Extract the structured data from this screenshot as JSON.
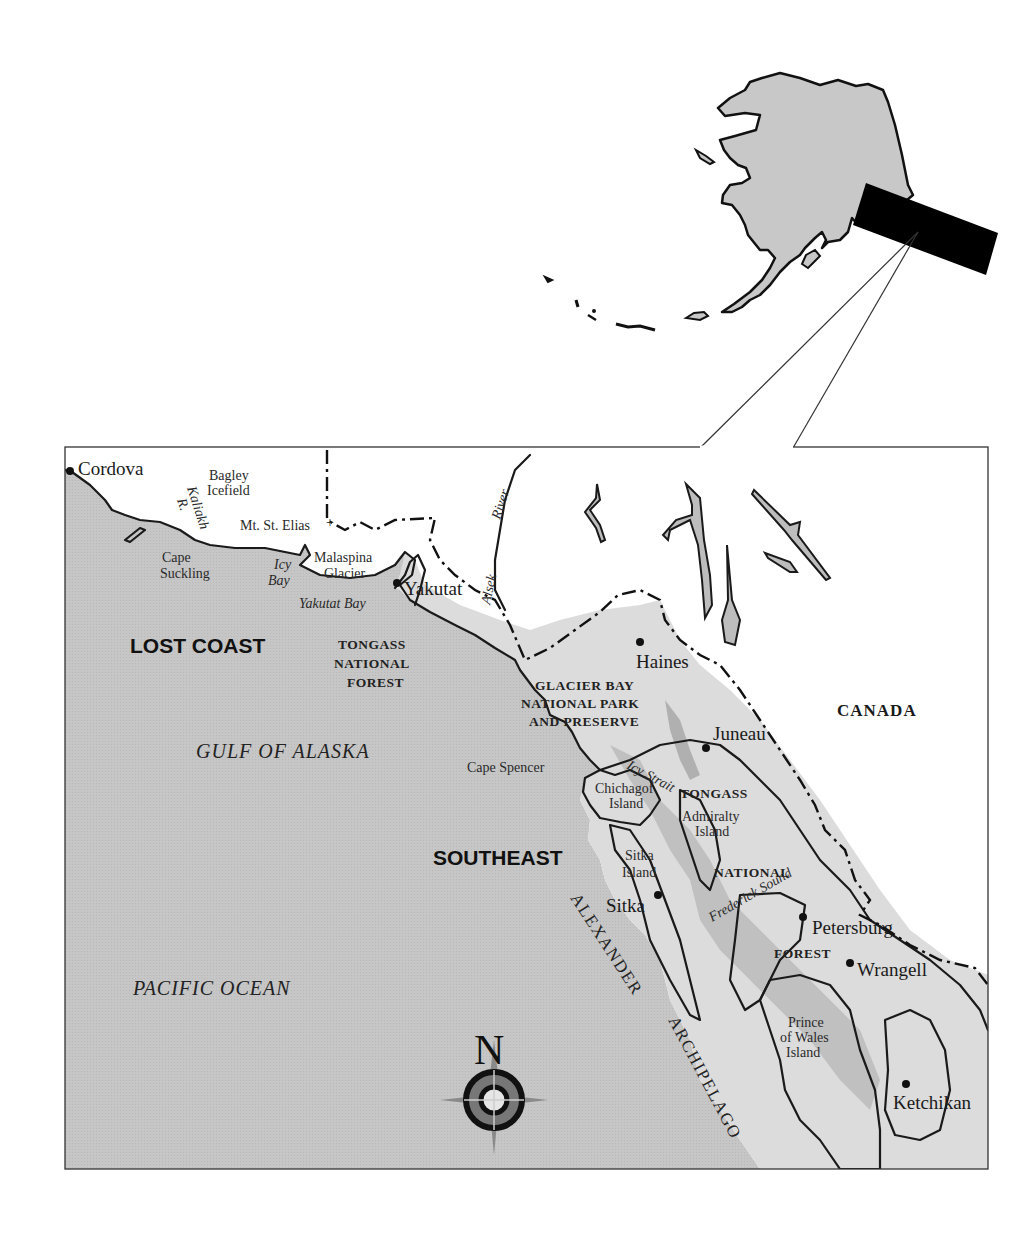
{
  "inset": {
    "title": "Alaska locator",
    "highlight_color": "#000000",
    "land_color": "#c8c8c8"
  },
  "colors": {
    "ocean": "#c4c4c4",
    "forest_land": "#dedede",
    "forest_dark": "#b4b4b4",
    "foreign_land": "#ffffff",
    "line": "#1a1a1a"
  },
  "cities": [
    {
      "name": "Cordova"
    },
    {
      "name": "Yakutat"
    },
    {
      "name": "Haines"
    },
    {
      "name": "Juneau"
    },
    {
      "name": "Sitka"
    },
    {
      "name": "Petersburg"
    },
    {
      "name": "Wrangell"
    },
    {
      "name": "Ketchikan"
    }
  ],
  "features": {
    "bagley": [
      "Bagley",
      "Icefield"
    ],
    "kaliakh": [
      "Kaliakh",
      "R."
    ],
    "mt_st_elias": "Mt. St. Elias",
    "cape_suckling": [
      "Cape",
      "Suckling"
    ],
    "icy_bay": [
      "Icy",
      "Bay"
    ],
    "malaspina": [
      "Malaspina",
      "Glacier"
    ],
    "yakutat_bay": "Yakutat Bay",
    "alsek": [
      "Alsek",
      "River"
    ],
    "cape_spencer": "Cape Spencer",
    "icy_strait": "Icy Strait",
    "chichagof": [
      "Chichagof",
      "Island"
    ],
    "admiralty": [
      "Admiralty",
      "Island"
    ],
    "sitka_island": [
      "Sitka",
      "Island"
    ],
    "frederick_sound": "Frederick Sound",
    "prince_of_wales": [
      "Prince",
      "of Wales",
      "Island"
    ]
  },
  "regions": {
    "lost_coast": "LOST COAST",
    "southeast": "SOUTHEAST",
    "canada": "CANADA",
    "tongass_west": [
      "TONGASS",
      "NATIONAL",
      "FOREST"
    ],
    "glacier_bay": [
      "GLACIER BAY",
      "NATIONAL PARK",
      "AND PRESERVE"
    ],
    "tongass_east": [
      "TONGASS",
      "NATIONAL",
      "FOREST"
    ]
  },
  "water": {
    "gulf": "GULF  OF  ALASKA",
    "pacific": "PACIFIC  OCEAN",
    "archipelago_1": "ALEXANDER",
    "archipelago_2": "ARCHIPELAGO"
  },
  "compass": {
    "north_label": "N"
  }
}
